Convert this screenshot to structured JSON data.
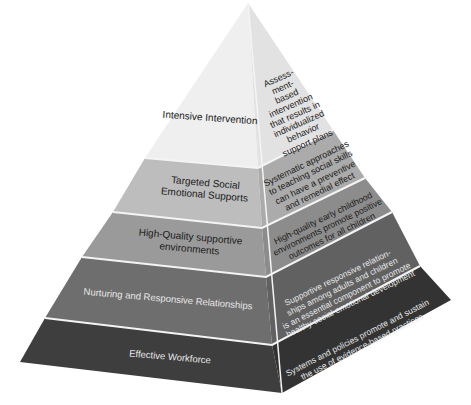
{
  "diagram": {
    "type": "pyramid",
    "levels": [
      {
        "name": "Intensive Intervention",
        "description": "Assess-\nment-\nbased\nintervention\nthat results in\nindividualized\nbehavior\nsupport plans",
        "left_color": "#efefef",
        "right_color": "#e2e2e2"
      },
      {
        "name": "Targeted Social\nEmotional Supports",
        "description": "Systematic approaches\nto teaching social skills\ncan have a preventive\nand remedial effect",
        "left_color": "#bdbdbd",
        "right_color": "#ababab"
      },
      {
        "name": "High-Quality supportive\nenvironments",
        "description": "High-quality early childhood\nenvironments promote positive\noutcomes for all children",
        "left_color": "#9a9a9a",
        "right_color": "#8c8c8c"
      },
      {
        "name": "Nurturing and Responsive Relationships",
        "description": "Supportive responsive relation-\nships among adults and children\nis an essential component to promote\nhealthy social emotional development",
        "left_color": "#6e6e6e",
        "right_color": "#616161"
      },
      {
        "name": "Effective Workforce",
        "description": "Systems and policies promote and sustain\nthe use of evidence-based practices",
        "left_color": "#3e3e3e",
        "right_color": "#333333"
      }
    ],
    "separator_color": "#f4f4f4"
  }
}
